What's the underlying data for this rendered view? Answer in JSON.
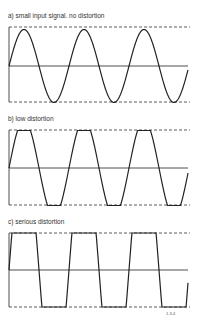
{
  "panels": [
    {
      "label": "a) small input signal. no distortion",
      "type": "sine",
      "top": 27,
      "zero": 66,
      "bottom": 102,
      "clip": 0
    },
    {
      "label": "b) low distortion",
      "type": "clipped",
      "top": 130,
      "zero": 168,
      "bottom": 205,
      "clip": 0.78
    },
    {
      "label": "c) serious distortion",
      "type": "clipped",
      "top": 233,
      "zero": 270,
      "bottom": 307,
      "clip": 0.3
    }
  ],
  "figure_id": "1-3-4",
  "colors": {
    "stroke": "#222222",
    "dash": "#333333"
  }
}
